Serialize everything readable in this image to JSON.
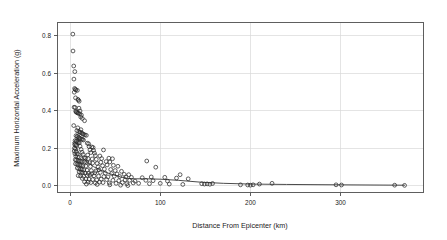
{
  "chart_data": {
    "type": "scatter",
    "title": "",
    "xlabel": "Distance From Epicenter (km)",
    "ylabel": "Maximum Horizontal Acceleration (g)",
    "xlim": [
      -14,
      392
    ],
    "ylim": [
      -0.035,
      0.872
    ],
    "xticks": [
      0,
      100,
      200,
      300
    ],
    "xticklabels": [
      "0",
      "100",
      "200",
      "300"
    ],
    "yticks": [
      0.0,
      0.2,
      0.4,
      0.6,
      0.8
    ],
    "yticklabels": [
      "0.0",
      "0.2",
      "0.4",
      "0.6",
      "0.8"
    ],
    "grid": true,
    "legend": null,
    "marker": "open-circle",
    "marker_color": "#2b2b2b",
    "points": [
      [
        3.0,
        0.81
      ],
      [
        3.2,
        0.72
      ],
      [
        4.0,
        0.64
      ],
      [
        5.2,
        0.61
      ],
      [
        4.2,
        0.57
      ],
      [
        5.0,
        0.52
      ],
      [
        5.8,
        0.515
      ],
      [
        6.4,
        0.512
      ],
      [
        8.0,
        0.51
      ],
      [
        4.6,
        0.5
      ],
      [
        6.0,
        0.47
      ],
      [
        8.6,
        0.462
      ],
      [
        9.2,
        0.458
      ],
      [
        10.0,
        0.452
      ],
      [
        4.4,
        0.42
      ],
      [
        5.6,
        0.418
      ],
      [
        9.8,
        0.415
      ],
      [
        11.0,
        0.4
      ],
      [
        6.2,
        0.398
      ],
      [
        6.8,
        0.395
      ],
      [
        7.4,
        0.392
      ],
      [
        8.2,
        0.39
      ],
      [
        9.0,
        0.388
      ],
      [
        10.6,
        0.385
      ],
      [
        12.5,
        0.378
      ],
      [
        11.8,
        0.368
      ],
      [
        13.5,
        0.36
      ],
      [
        16.0,
        0.348
      ],
      [
        4.0,
        0.322
      ],
      [
        8.5,
        0.31
      ],
      [
        12.0,
        0.3
      ],
      [
        7.5,
        0.295
      ],
      [
        9.5,
        0.29
      ],
      [
        10.8,
        0.288
      ],
      [
        11.5,
        0.285
      ],
      [
        13.0,
        0.282
      ],
      [
        14.0,
        0.278
      ],
      [
        15.0,
        0.275
      ],
      [
        16.5,
        0.272
      ],
      [
        18.0,
        0.27
      ],
      [
        6.5,
        0.268
      ],
      [
        7.8,
        0.265
      ],
      [
        8.8,
        0.262
      ],
      [
        9.9,
        0.258
      ],
      [
        10.5,
        0.255
      ],
      [
        11.2,
        0.252
      ],
      [
        12.8,
        0.25
      ],
      [
        13.8,
        0.248
      ],
      [
        14.8,
        0.245
      ],
      [
        5.5,
        0.242
      ],
      [
        6.9,
        0.24
      ],
      [
        7.2,
        0.238
      ],
      [
        8.1,
        0.235
      ],
      [
        9.3,
        0.232
      ],
      [
        10.2,
        0.23
      ],
      [
        19.0,
        0.228
      ],
      [
        20.5,
        0.225
      ],
      [
        5.0,
        0.222
      ],
      [
        6.1,
        0.218
      ],
      [
        7.0,
        0.215
      ],
      [
        11.0,
        0.212
      ],
      [
        21.0,
        0.21
      ],
      [
        24.0,
        0.208
      ],
      [
        25.5,
        0.205
      ],
      [
        4.8,
        0.202
      ],
      [
        5.9,
        0.198
      ],
      [
        12.2,
        0.195
      ],
      [
        22.0,
        0.192
      ],
      [
        26.0,
        0.19
      ],
      [
        37.0,
        0.192
      ],
      [
        4.5,
        0.186
      ],
      [
        6.6,
        0.182
      ],
      [
        13.2,
        0.18
      ],
      [
        23.0,
        0.178
      ],
      [
        27.0,
        0.175
      ],
      [
        5.3,
        0.172
      ],
      [
        7.7,
        0.17
      ],
      [
        14.5,
        0.168
      ],
      [
        19.5,
        0.165
      ],
      [
        28.0,
        0.162
      ],
      [
        33.0,
        0.16
      ],
      [
        6.3,
        0.158
      ],
      [
        8.4,
        0.155
      ],
      [
        10.0,
        0.152
      ],
      [
        15.5,
        0.15
      ],
      [
        17.0,
        0.148
      ],
      [
        20.0,
        0.146
      ],
      [
        24.5,
        0.144
      ],
      [
        29.0,
        0.142
      ],
      [
        35.0,
        0.146
      ],
      [
        43.0,
        0.148
      ],
      [
        47.0,
        0.145
      ],
      [
        5.7,
        0.14
      ],
      [
        7.1,
        0.138
      ],
      [
        8.9,
        0.136
      ],
      [
        10.4,
        0.134
      ],
      [
        11.9,
        0.132
      ],
      [
        13.4,
        0.13
      ],
      [
        16.2,
        0.128
      ],
      [
        18.5,
        0.126
      ],
      [
        21.5,
        0.124
      ],
      [
        25.0,
        0.122
      ],
      [
        30.0,
        0.12
      ],
      [
        34.0,
        0.126
      ],
      [
        40.0,
        0.13
      ],
      [
        44.0,
        0.128
      ],
      [
        85.0,
        0.133
      ],
      [
        6.0,
        0.118
      ],
      [
        7.6,
        0.116
      ],
      [
        9.1,
        0.114
      ],
      [
        10.9,
        0.112
      ],
      [
        12.4,
        0.11
      ],
      [
        14.2,
        0.108
      ],
      [
        17.5,
        0.106
      ],
      [
        22.5,
        0.104
      ],
      [
        31.0,
        0.102
      ],
      [
        36.0,
        0.108
      ],
      [
        41.0,
        0.112
      ],
      [
        48.0,
        0.11
      ],
      [
        53.0,
        0.105
      ],
      [
        95.0,
        0.1
      ],
      [
        8.0,
        0.095
      ],
      [
        9.6,
        0.092
      ],
      [
        11.4,
        0.09
      ],
      [
        13.0,
        0.088
      ],
      [
        15.2,
        0.086
      ],
      [
        18.8,
        0.084
      ],
      [
        23.5,
        0.082
      ],
      [
        28.5,
        0.08
      ],
      [
        32.0,
        0.086
      ],
      [
        38.0,
        0.09
      ],
      [
        45.0,
        0.088
      ],
      [
        50.0,
        0.082
      ],
      [
        57.0,
        0.078
      ],
      [
        10.0,
        0.075
      ],
      [
        12.0,
        0.073
      ],
      [
        14.0,
        0.071
      ],
      [
        16.8,
        0.069
      ],
      [
        20.2,
        0.067
      ],
      [
        24.0,
        0.065
      ],
      [
        27.5,
        0.07
      ],
      [
        33.5,
        0.072
      ],
      [
        39.0,
        0.068
      ],
      [
        46.0,
        0.066
      ],
      [
        52.0,
        0.064
      ],
      [
        60.0,
        0.062
      ],
      [
        65.0,
        0.06
      ],
      [
        122.0,
        0.06
      ],
      [
        9.0,
        0.055
      ],
      [
        11.5,
        0.053
      ],
      [
        15.0,
        0.051
      ],
      [
        19.0,
        0.056
      ],
      [
        22.0,
        0.058
      ],
      [
        26.5,
        0.054
      ],
      [
        31.5,
        0.052
      ],
      [
        37.5,
        0.05
      ],
      [
        42.0,
        0.048
      ],
      [
        49.0,
        0.052
      ],
      [
        55.0,
        0.05
      ],
      [
        62.0,
        0.048
      ],
      [
        68.0,
        0.046
      ],
      [
        80.0,
        0.044
      ],
      [
        90.0,
        0.048
      ],
      [
        105.0,
        0.046
      ],
      [
        118.0,
        0.042
      ],
      [
        131.0,
        0.038
      ],
      [
        13.5,
        0.04
      ],
      [
        17.5,
        0.038
      ],
      [
        21.0,
        0.036
      ],
      [
        25.0,
        0.034
      ],
      [
        29.5,
        0.032
      ],
      [
        34.5,
        0.036
      ],
      [
        40.5,
        0.034
      ],
      [
        47.5,
        0.03
      ],
      [
        54.0,
        0.028
      ],
      [
        61.0,
        0.032
      ],
      [
        66.0,
        0.03
      ],
      [
        72.0,
        0.026
      ],
      [
        84.0,
        0.03
      ],
      [
        92.0,
        0.028
      ],
      [
        108.0,
        0.026
      ],
      [
        16.0,
        0.022
      ],
      [
        20.0,
        0.02
      ],
      [
        23.0,
        0.018
      ],
      [
        28.0,
        0.016
      ],
      [
        32.5,
        0.02
      ],
      [
        36.5,
        0.018
      ],
      [
        43.5,
        0.016
      ],
      [
        51.0,
        0.014
      ],
      [
        58.0,
        0.018
      ],
      [
        63.0,
        0.012
      ],
      [
        70.0,
        0.016
      ],
      [
        76.0,
        0.014
      ],
      [
        88.0,
        0.012
      ],
      [
        100.0,
        0.014
      ],
      [
        110.0,
        0.01
      ],
      [
        125.0,
        0.008
      ],
      [
        18.0,
        0.01
      ],
      [
        30.0,
        0.008
      ],
      [
        44.0,
        0.006
      ],
      [
        56.0,
        0.004
      ],
      [
        64.0,
        0.002
      ],
      [
        146.0,
        0.012
      ],
      [
        149.0,
        0.01
      ],
      [
        152.0,
        0.011
      ],
      [
        155.0,
        0.009
      ],
      [
        158.0,
        0.013
      ],
      [
        189.0,
        0.006
      ],
      [
        197.0,
        0.005
      ],
      [
        200.0,
        0.004
      ],
      [
        203.0,
        0.006
      ],
      [
        210.0,
        0.01
      ],
      [
        224.0,
        0.014
      ],
      [
        295.0,
        0.006
      ],
      [
        301.0,
        0.005
      ],
      [
        360.0,
        0.004
      ],
      [
        371.0,
        0.003
      ]
    ],
    "smooth_curve": {
      "label": "lowess-smooth",
      "x": [
        3,
        6,
        10,
        15,
        20,
        26,
        32,
        40,
        48,
        56,
        64,
        72,
        85,
        100,
        120,
        145,
        170,
        200,
        240,
        300,
        371
      ],
      "y": [
        0.232,
        0.21,
        0.175,
        0.146,
        0.124,
        0.103,
        0.088,
        0.072,
        0.059,
        0.048,
        0.04,
        0.038,
        0.038,
        0.036,
        0.03,
        0.02,
        0.014,
        0.01,
        0.008,
        0.006,
        0.004
      ]
    }
  }
}
